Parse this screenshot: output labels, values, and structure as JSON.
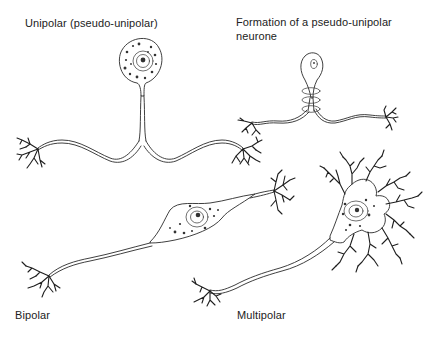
{
  "figure": {
    "panels": [
      {
        "id": "unipolar",
        "label": "Unipolar (pseudo-unipolar)"
      },
      {
        "id": "formation",
        "label": "Formation of a pseudo-unipolar neurone"
      },
      {
        "id": "bipolar",
        "label": "Bipolar"
      },
      {
        "id": "multipolar",
        "label": "Multipolar"
      }
    ]
  },
  "colors": {
    "ink": "#2a2a2a",
    "background": "#ffffff"
  }
}
